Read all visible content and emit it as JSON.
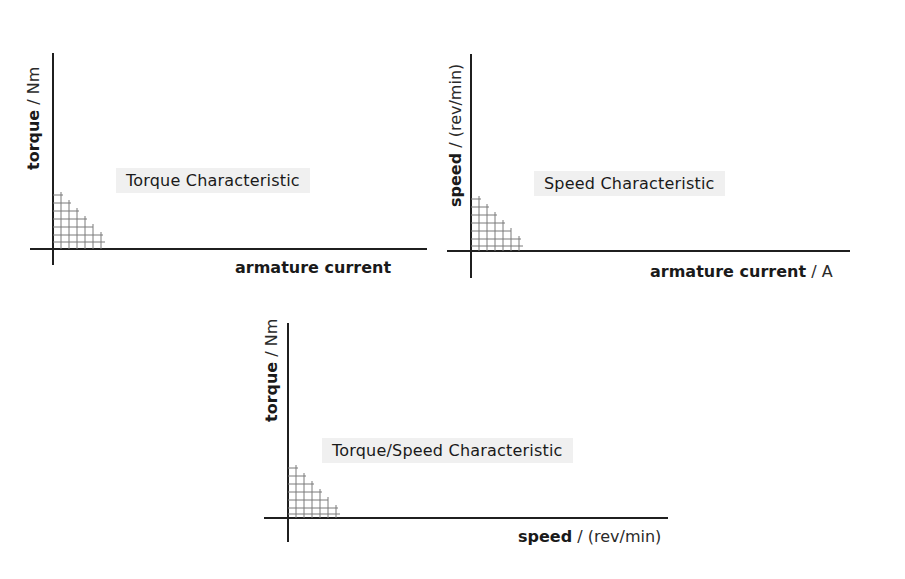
{
  "panels": [
    {
      "id": "torque",
      "title": "Torque Characteristic",
      "xlabel": {
        "name": "armature current",
        "unit": ""
      },
      "ylabel": {
        "name": "torque",
        "unit": " / Nm"
      }
    },
    {
      "id": "speed",
      "title": "Speed Characteristic",
      "xlabel": {
        "name": "armature current",
        "unit": " / A"
      },
      "ylabel": {
        "name": "speed",
        "unit": " / (rev/min)"
      }
    },
    {
      "id": "torque-speed",
      "title": "Torque/Speed Characteristic",
      "xlabel": {
        "name": "speed",
        "unit": " / (rev/min)"
      },
      "ylabel": {
        "name": "torque",
        "unit": " / Nm"
      }
    }
  ],
  "colors": {
    "axis": "#1f1f1f",
    "label_box": "#f0f0f0",
    "hatch": "#7a7a7a"
  }
}
